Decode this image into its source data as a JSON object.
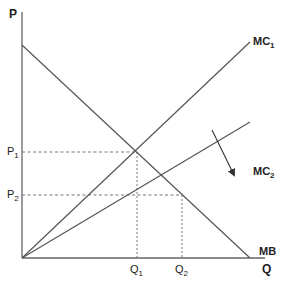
{
  "diagram": {
    "axes": {
      "y_label": "P",
      "x_label": "Q"
    },
    "curves": {
      "mc1": {
        "label": "MC",
        "subscript": "1"
      },
      "mc2": {
        "label": "MC",
        "subscript": "2"
      },
      "mb": {
        "label": "MB"
      }
    },
    "price_levels": [
      {
        "label": "P",
        "subscript": "1"
      },
      {
        "label": "P",
        "subscript": "2"
      }
    ],
    "quantity_levels": [
      {
        "label": "Q",
        "subscript": "1"
      },
      {
        "label": "Q",
        "subscript": "2"
      }
    ],
    "colors": {
      "line": "#555555",
      "text": "#222222",
      "dashed": "#777777"
    }
  }
}
